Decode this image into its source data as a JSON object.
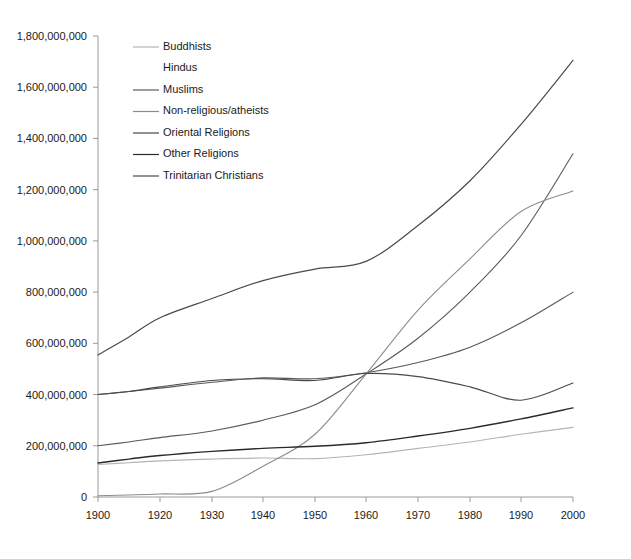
{
  "chart_data": {
    "type": "line",
    "title": "",
    "xlabel": "",
    "ylabel": "",
    "xlim": [
      1900,
      2000
    ],
    "ylim": [
      0,
      1800000000
    ],
    "grid": false,
    "legend_position": "top-left-inside",
    "x_ticks": [
      1900,
      1920,
      1930,
      1940,
      1950,
      1960,
      1970,
      1980,
      1990,
      2000
    ],
    "x_tick_labels": [
      "1900",
      "1920",
      "1930",
      "1940",
      "1950",
      "1960",
      "1970",
      "1980",
      "1990",
      "2000"
    ],
    "y_ticks": [
      0,
      200000000,
      400000000,
      600000000,
      800000000,
      1000000000,
      1200000000,
      1400000000,
      1600000000,
      1800000000
    ],
    "y_tick_labels": [
      "0",
      "200,000,000",
      "400,000,000",
      "600,000,000",
      "800,000,000",
      "1,000,000,000",
      "1,200,000,000",
      "1,400,000,000",
      "1,600,000,000",
      "1,800,000,000"
    ],
    "x": [
      1900,
      1910,
      1920,
      1930,
      1940,
      1950,
      1960,
      1970,
      1980,
      1990,
      2000
    ],
    "series": [
      {
        "name": "Buddhists",
        "color": "#b4b4b4",
        "width": 1.1,
        "values": [
          127000000,
          134000000,
          141000000,
          148000000,
          152000000,
          150000000,
          165000000,
          190000000,
          215000000,
          245000000,
          272000000
        ]
      },
      {
        "name": "Hindus",
        "color": "#585858",
        "width": 1.1,
        "values": [
          400000000,
          412000000,
          425000000,
          448000000,
          465000000,
          462000000,
          485000000,
          525000000,
          585000000,
          680000000,
          800000000
        ]
      },
      {
        "name": "Muslims",
        "color": "#5a5a5a",
        "width": 1.1,
        "values": [
          200000000,
          215000000,
          232000000,
          258000000,
          300000000,
          360000000,
          480000000,
          620000000,
          800000000,
          1020000000,
          1340000000
        ]
      },
      {
        "name": "Non-religious/atheists",
        "color": "#8c8c8c",
        "width": 1.1,
        "values": [
          5000000,
          8000000,
          12000000,
          22000000,
          120000000,
          245000000,
          480000000,
          730000000,
          930000000,
          1115000000,
          1195000000
        ]
      },
      {
        "name": "Oriental Religions",
        "color": "#4a4a4a",
        "width": 1.1,
        "values": [
          400000000,
          412000000,
          430000000,
          455000000,
          462000000,
          455000000,
          482000000,
          470000000,
          430000000,
          378000000,
          445000000
        ]
      },
      {
        "name": "Other Religions",
        "color": "#2a2a2a",
        "width": 1.4,
        "values": [
          133000000,
          148000000,
          162000000,
          178000000,
          190000000,
          198000000,
          212000000,
          238000000,
          268000000,
          305000000,
          348000000
        ]
      },
      {
        "name": "Trinitarian Christians",
        "color": "#4a4a4a",
        "width": 1.2,
        "values": [
          555000000,
          625000000,
          700000000,
          775000000,
          845000000,
          890000000,
          920000000,
          1060000000,
          1235000000,
          1455000000,
          1705000000
        ]
      }
    ],
    "legend_entries": [
      {
        "label": "Buddhists",
        "color": "#b4b4b4",
        "show_swatch": true
      },
      {
        "label": "Hindus",
        "color": "#f2f2f2",
        "show_swatch": false
      },
      {
        "label": "Muslims",
        "color": "#5a5a5a",
        "show_swatch": true
      },
      {
        "label": "Non-religious/atheists",
        "color": "#8c8c8c",
        "show_swatch": true
      },
      {
        "label": "Oriental Religions",
        "color": "#4a4a4a",
        "show_swatch": true
      },
      {
        "label": "Other Religions",
        "color": "#2a2a2a",
        "show_swatch": true
      },
      {
        "label": "Trinitarian Christians",
        "color": "#4a4a4a",
        "show_swatch": true
      }
    ]
  },
  "axes": {
    "axis_color": "#9a9a9a"
  }
}
